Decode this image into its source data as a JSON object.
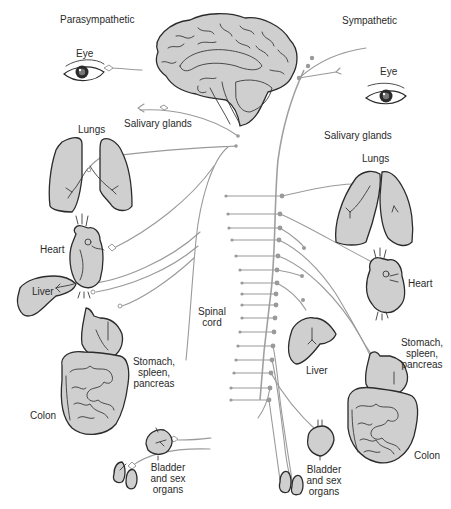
{
  "diagram": {
    "title_left": "Parasympathetic",
    "title_right": "Sympathetic",
    "center_label": "Spinal cord",
    "colors": {
      "organ_fill": "#cfcfcf",
      "outline": "#2b2b2b",
      "nerve": "#9a9a9a",
      "background": "#ffffff"
    },
    "parasympathetic": {
      "labels": {
        "eye": "Eye",
        "salivary": "Salivary glands",
        "lungs": "Lungs",
        "heart": "Heart",
        "liver": "Liver",
        "stomach_l1": "Stomach,",
        "stomach_l2": "spleen,",
        "stomach_l3": "pancreas",
        "colon": "Colon",
        "bladder_l1": "Bladder",
        "bladder_l2": "and sex",
        "bladder_l3": "organs"
      }
    },
    "sympathetic": {
      "labels": {
        "eye": "Eye",
        "salivary": "Salivary glands",
        "lungs": "Lungs",
        "heart": "Heart",
        "liver": "Liver",
        "stomach_l1": "Stomach,",
        "stomach_l2": "spleen,",
        "stomach_l3": "pancreas",
        "colon": "Colon",
        "bladder_l1": "Bladder",
        "bladder_l2": "and sex",
        "bladder_l3": "organs"
      }
    },
    "spinal": {
      "label_l1": "Spinal",
      "label_l2": "cord",
      "segment_count": 16
    }
  }
}
